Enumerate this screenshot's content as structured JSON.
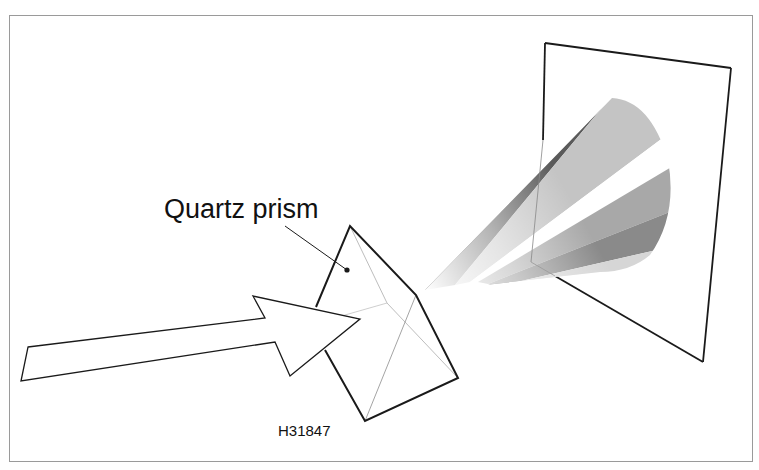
{
  "figure": {
    "labels": {
      "prism": "Quartz prism",
      "figure_id": "H31847"
    },
    "elements": {
      "incident_arrow": "Incoming light arrow",
      "prism": "Quartz prism",
      "dispersed_beam": "Dispersed light spectrum",
      "screen": "Projection screen"
    },
    "colors": {
      "outline": "#1a1a1a",
      "hidden_edge": "#b5b5b5",
      "frame_border": "#9a9a9a",
      "band_dark": "#5a5a5a",
      "band_light": "#c4c4c4",
      "band_mid": "#a8a8a8",
      "band_mid_dark": "#8a8a8a",
      "band_pale": "#d6d6d6"
    }
  }
}
